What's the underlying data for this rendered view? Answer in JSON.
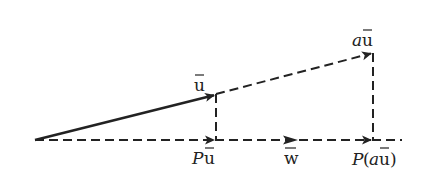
{
  "diagram": {
    "type": "vector-projection",
    "stroke_color": "#222222",
    "background": "#ffffff",
    "points": {
      "origin": [
        35,
        140
      ],
      "u_tip": [
        215,
        95
      ],
      "Pu": [
        215,
        140
      ],
      "au_tip": [
        372,
        53
      ],
      "Pau": [
        372,
        140
      ],
      "baseline_end": [
        402,
        140
      ]
    },
    "labels": {
      "u": "u",
      "au_a": "a",
      "au_u": "u",
      "Pu_P": "P",
      "Pu_u": "u",
      "w": "w",
      "Pau_P": "P(",
      "Pau_a": "a",
      "Pau_u": "u",
      "Pau_close": ")"
    },
    "edges": [
      {
        "from": "origin",
        "to": "u_tip",
        "style": "solid",
        "arrow": true,
        "label": "u"
      },
      {
        "from": "origin",
        "to": "Pu",
        "style": "dashed",
        "arrow": true,
        "label": "Pu"
      },
      {
        "from": "u_tip",
        "to": "au_tip",
        "style": "dashed",
        "arrow": true,
        "label": "au"
      },
      {
        "from": "u_tip",
        "to": "Pu",
        "style": "dashed",
        "arrow": false
      },
      {
        "from": "au_tip",
        "to": "Pau",
        "style": "dashed",
        "arrow": false
      },
      {
        "from": "Pu",
        "to": "Pau",
        "style": "dashed",
        "arrow": true,
        "label": "P(au)"
      },
      {
        "from": "Pau",
        "to": "baseline_end",
        "style": "dashed",
        "arrow": false
      },
      {
        "marker": "w",
        "at": [
          297,
          140
        ],
        "style": "arrowhead",
        "label": "w"
      }
    ]
  }
}
